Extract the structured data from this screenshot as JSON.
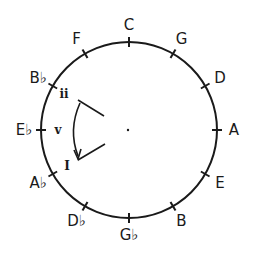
{
  "diagram": {
    "center": [
      129,
      130
    ],
    "radius": 88,
    "stroke_color": "#1a1a1a",
    "notes": [
      {
        "label": "C",
        "angle": 0
      },
      {
        "label": "G",
        "angle": 30
      },
      {
        "label": "D",
        "angle": 60
      },
      {
        "label": "A",
        "angle": 90
      },
      {
        "label": "E",
        "angle": 120
      },
      {
        "label": "B",
        "angle": 150
      },
      {
        "label": "G♭",
        "angle": 180
      },
      {
        "label": "D♭",
        "angle": 210
      },
      {
        "label": "A♭",
        "angle": 240
      },
      {
        "label": "E♭",
        "angle": 270
      },
      {
        "label": "B♭",
        "angle": 300
      },
      {
        "label": "F",
        "angle": 330
      }
    ],
    "roman_numerals": [
      {
        "label": "ii",
        "x": 64,
        "y": 98
      },
      {
        "label": "v",
        "x": 58,
        "y": 134
      },
      {
        "label": "I",
        "x": 67,
        "y": 170
      }
    ],
    "progression_arrow": {
      "from": "ii",
      "to": "I",
      "direction": "clockwise-down"
    }
  }
}
